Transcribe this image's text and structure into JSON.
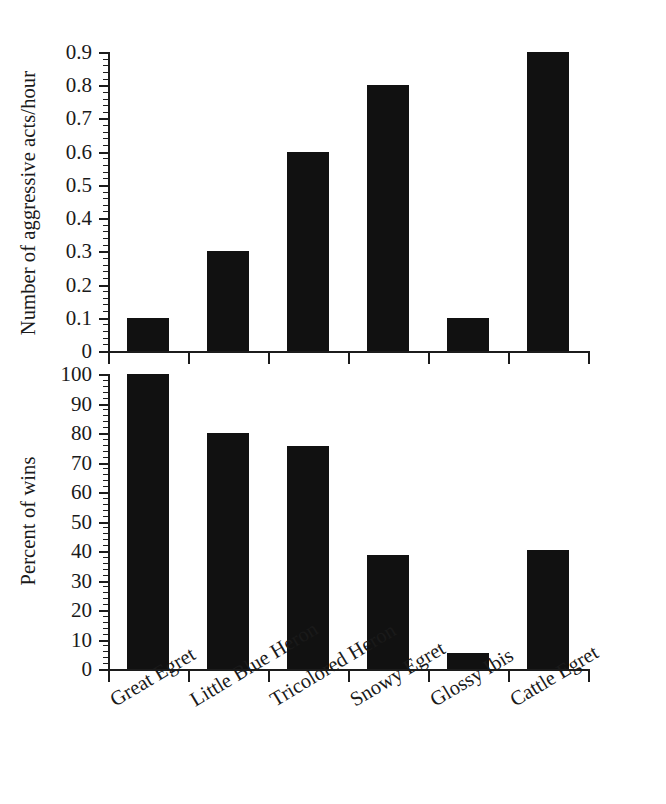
{
  "figure": {
    "background": "#ffffff",
    "bar_color": "#111111",
    "axis_color": "#1c1c1c"
  },
  "categories": [
    "Great Egret",
    "Little Blue Heron",
    "Tricolored Heron",
    "Snowy Egret",
    "Glossy Ibis",
    "Cattle Egret"
  ],
  "top_panel": {
    "ylabel": "Number of aggressive acts/hour",
    "ytick_labels": [
      "0",
      "0.1",
      "0.2",
      "0.3",
      "0.4",
      "0.5",
      "0.6",
      "0.7",
      "0.8",
      "0.9"
    ],
    "values": [
      0.1,
      0.3,
      0.6,
      0.8,
      0.1,
      0.9
    ]
  },
  "bottom_panel": {
    "ylabel": "Percent of wins",
    "ytick_labels": [
      "0",
      "10",
      "20",
      "30",
      "40",
      "50",
      "60",
      "70",
      "80",
      "90",
      "100"
    ],
    "values": [
      100,
      80,
      75.5,
      38.5,
      5.5,
      40.5
    ]
  },
  "chart_data": [
    {
      "type": "bar",
      "title": "",
      "panel": "top",
      "categories": [
        "Great Egret",
        "Little Blue Heron",
        "Tricolored Heron",
        "Snowy Egret",
        "Glossy Ibis",
        "Cattle Egret"
      ],
      "values": [
        0.1,
        0.3,
        0.6,
        0.8,
        0.1,
        0.9
      ],
      "xlabel": "",
      "ylabel": "Number of aggressive acts/hour",
      "ylim": [
        0,
        0.9
      ],
      "ytick_major_step": 0.1,
      "ytick_minor_step": 0.02,
      "ytick_labels": [
        "0",
        "0.1",
        "0.2",
        "0.3",
        "0.4",
        "0.5",
        "0.6",
        "0.7",
        "0.8",
        "0.9"
      ],
      "grid": false,
      "legend": false,
      "bar_color": "#111111"
    },
    {
      "type": "bar",
      "title": "",
      "panel": "bottom",
      "categories": [
        "Great Egret",
        "Little Blue Heron",
        "Tricolored Heron",
        "Snowy Egret",
        "Glossy Ibis",
        "Cattle Egret"
      ],
      "values": [
        100,
        80,
        75.5,
        38.5,
        5.5,
        40.5
      ],
      "xlabel": "",
      "ylabel": "Percent of wins",
      "ylim": [
        0,
        100
      ],
      "ytick_major_step": 10,
      "ytick_minor_step": 2,
      "ytick_labels": [
        "0",
        "10",
        "20",
        "30",
        "40",
        "50",
        "60",
        "70",
        "80",
        "90",
        "100"
      ],
      "grid": false,
      "legend": false,
      "bar_color": "#111111"
    }
  ]
}
